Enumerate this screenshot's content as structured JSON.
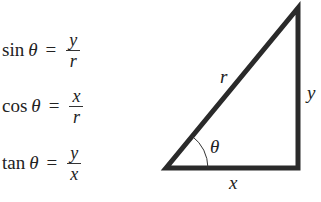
{
  "equations": [
    {
      "fn": "sin",
      "theta": "θ",
      "eq": "=",
      "num": "y",
      "den": "r"
    },
    {
      "fn": "cos",
      "theta": "θ",
      "eq": "=",
      "num": "x",
      "den": "r"
    },
    {
      "fn": "tan",
      "theta": "θ",
      "eq": "=",
      "num": "y",
      "den": "x"
    }
  ],
  "triangle": {
    "hypotenuse_label": "r",
    "opposite_label": "y",
    "adjacent_label": "x",
    "angle_label": "θ",
    "stroke_color": "#2a2a2a"
  }
}
